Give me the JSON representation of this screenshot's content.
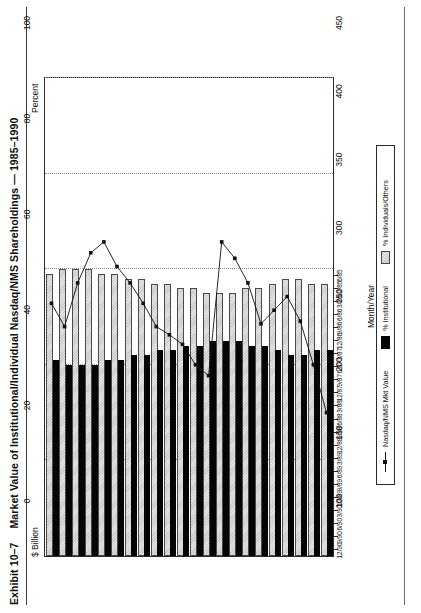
{
  "exhibit": {
    "number": "Exhibit 10–7",
    "title": "Market Value of Institutional/Individual Nasdaq/NMS Shareholdings — 1985–1990"
  },
  "axes": {
    "left_label": "$ Billion",
    "right_label": "Percent",
    "x_title": "Month/Year",
    "percent_ticks": [
      "0",
      "20",
      "40",
      "60",
      "80",
      "100"
    ],
    "billion_ticks": [
      "100",
      "150",
      "200",
      "250",
      "300",
      "350",
      "400",
      "450"
    ]
  },
  "legend": {
    "items": [
      {
        "label": "Nasdaq/NMS Mkt Value",
        "marker": "line-marker-icon",
        "color": "#111111"
      },
      {
        "label": "% Institutional",
        "marker": "black-swatch-icon",
        "color": "#050505"
      },
      {
        "label": "% Individuals/Others",
        "marker": "gray-swatch-icon",
        "color": "#d2d2d2"
      }
    ]
  },
  "chart_data": {
    "type": "bar",
    "title": "Market Value of Institutional/Individual Nasdaq/NMS Shareholdings — 1985–1990",
    "xlabel": "Month/Year",
    "ylabel": "Percent",
    "y2label": "$ Billion",
    "ylim": [
      0,
      100
    ],
    "y2lim": [
      100,
      450
    ],
    "grid": true,
    "legend_position": "bottom",
    "orientation": "vertical-printed-rotated",
    "categories": [
      "6/85",
      "12/85",
      "3/86",
      "6/86",
      "9/86",
      "12/86",
      "3/87",
      "6/87",
      "9/87",
      "12/87",
      "3/88",
      "6/88",
      "9/88",
      "12/88",
      "3/89",
      "6/89",
      "9/89",
      "12/89",
      "3/90",
      "6/90",
      "9/90",
      "12/90"
    ],
    "series": [
      {
        "name": "% Institutional",
        "axis": "left",
        "type": "bar",
        "color": "#050505",
        "values": [
          43,
          43,
          42,
          42,
          43,
          44,
          44,
          45,
          45,
          45,
          44,
          44,
          43,
          43,
          42,
          42,
          41,
          41,
          40,
          40,
          40,
          41
        ]
      },
      {
        "name": "% Individuals/Others",
        "axis": "left",
        "type": "bar",
        "color": "#d2d2d2",
        "values": [
          57,
          57,
          58,
          58,
          57,
          56,
          56,
          55,
          55,
          55,
          56,
          56,
          57,
          57,
          58,
          58,
          59,
          59,
          60,
          60,
          60,
          59
        ]
      },
      {
        "name": "Nasdaq/NMS Mkt Value",
        "axis": "right",
        "type": "line",
        "color": "#111111",
        "values": [
          205,
          240,
          272,
          290,
          280,
          270,
          300,
          318,
          330,
          232,
          240,
          255,
          262,
          268,
          285,
          300,
          312,
          330,
          322,
          300,
          268,
          285
        ]
      }
    ]
  }
}
